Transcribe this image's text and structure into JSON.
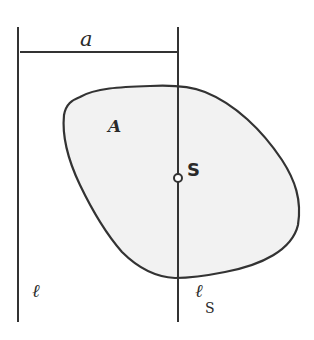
{
  "diagram": {
    "labels": {
      "distance": "a",
      "area": "A",
      "centroid": "S",
      "axis": "ℓ",
      "centroid_axis_main": "ℓ",
      "centroid_axis_sub": "S"
    },
    "colors": {
      "stroke": "#333333",
      "fill": "#f2f2f2",
      "background": "#ffffff"
    }
  }
}
